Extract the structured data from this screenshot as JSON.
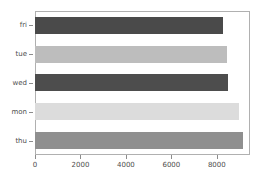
{
  "chart_data": {
    "type": "bar",
    "orientation": "horizontal",
    "title": "",
    "xlabel": "",
    "ylabel": "",
    "categories": [
      "fri",
      "tue",
      "wed",
      "mon",
      "thu"
    ],
    "values": [
      8265,
      8440,
      8485,
      8970,
      9140
    ],
    "bar_colors": [
      "#4a4a4a",
      "#bdbdbd",
      "#4d4d4d",
      "#dcdcdc",
      "#8f8f8f"
    ],
    "xlim": [
      0,
      9460
    ],
    "xticks": [
      0,
      2000,
      4000,
      6000,
      8000
    ],
    "xticklabels": [
      "0",
      "2000",
      "4000",
      "6000",
      "8000"
    ],
    "yticklabels": [
      "fri",
      "tue",
      "wed",
      "mon",
      "thu"
    ],
    "grid": false,
    "legend": null,
    "frame_color": "#b0b0b0",
    "tick_color": "#8c8c8c",
    "text_color": "#4d4d4d",
    "background": "#ffffff"
  }
}
